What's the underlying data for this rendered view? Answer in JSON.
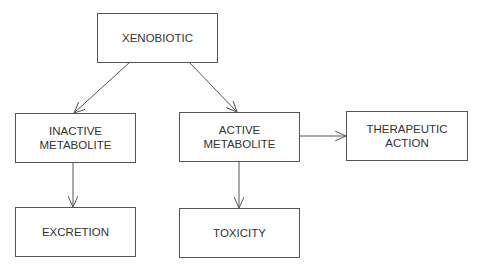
{
  "diagram": {
    "type": "flowchart",
    "colors": {
      "stroke": "#555555",
      "text": "#333333",
      "background": "#ffffff"
    },
    "nodes": [
      {
        "id": "xenobiotic",
        "label": "XENOBIOTIC"
      },
      {
        "id": "inactive",
        "label": "INACTIVE\nMETABOLITE"
      },
      {
        "id": "active",
        "label": "ACTIVE\nMETABOLITE"
      },
      {
        "id": "therapeutic",
        "label": "THERAPEUTIC\nACTION"
      },
      {
        "id": "excretion",
        "label": "EXCRETION"
      },
      {
        "id": "toxicity",
        "label": "TOXICITY"
      }
    ],
    "edges": [
      {
        "from": "xenobiotic",
        "to": "inactive"
      },
      {
        "from": "xenobiotic",
        "to": "active"
      },
      {
        "from": "inactive",
        "to": "excretion"
      },
      {
        "from": "active",
        "to": "toxicity"
      },
      {
        "from": "active",
        "to": "therapeutic"
      }
    ]
  }
}
